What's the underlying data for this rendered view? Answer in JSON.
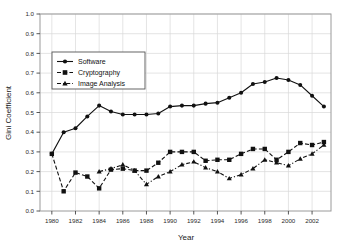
{
  "chart_data": {
    "type": "line",
    "title": "",
    "xlabel": "Year",
    "ylabel": "Gini Coefficient",
    "xlim": [
      1979,
      2003.6
    ],
    "ylim": [
      0.0,
      1.0
    ],
    "grid": true,
    "legend_position": "upper-left-inside",
    "x": [
      1980,
      1981,
      1982,
      1983,
      1984,
      1985,
      1986,
      1987,
      1988,
      1989,
      1990,
      1991,
      1992,
      1993,
      1994,
      1995,
      1996,
      1997,
      1998,
      1999,
      2000,
      2001,
      2002,
      2003
    ],
    "xticks": [
      1980,
      1982,
      1984,
      1986,
      1988,
      1990,
      1992,
      1994,
      1996,
      1998,
      2000,
      2002
    ],
    "xtick_labels": [
      "1980",
      "1982",
      "1984",
      "1986",
      "1988",
      "1990",
      "1992",
      "1994",
      "1996",
      "1998",
      "2000",
      "2002"
    ],
    "yticks": [
      0.0,
      0.1,
      0.2,
      0.3,
      0.4,
      0.5,
      0.6,
      0.7,
      0.8,
      0.9,
      1.0
    ],
    "ytick_labels": [
      "0.0",
      "0.1",
      "0.2",
      "0.3",
      "0.4",
      "0.5",
      "0.6",
      "0.7",
      "0.8",
      "0.9",
      "1.0"
    ],
    "series": [
      {
        "name": "Software",
        "marker": "circle",
        "linestyle": "solid",
        "color": "#111111",
        "x": [
          1980,
          1981,
          1982,
          1983,
          1984,
          1985,
          1986,
          1987,
          1988,
          1989,
          1990,
          1991,
          1992,
          1993,
          1994,
          1995,
          1996,
          1997,
          1998,
          1999,
          2000,
          2001,
          2002,
          2003
        ],
        "values": [
          0.29,
          0.4,
          0.42,
          0.48,
          0.535,
          0.505,
          0.49,
          0.49,
          0.49,
          0.495,
          0.53,
          0.535,
          0.535,
          0.545,
          0.55,
          0.575,
          0.6,
          0.645,
          0.655,
          0.675,
          0.665,
          0.64,
          0.585,
          0.53
        ]
      },
      {
        "name": "Cryptography",
        "marker": "square",
        "linestyle": "dashed",
        "color": "#111111",
        "x": [
          1980,
          1981,
          1982,
          1983,
          1984,
          1985,
          1986,
          1987,
          1988,
          1989,
          1990,
          1991,
          1992,
          1993,
          1994,
          1995,
          1996,
          1997,
          1998,
          1999,
          2000,
          2001,
          2002,
          2003
        ],
        "values": [
          0.29,
          0.1,
          0.195,
          0.175,
          0.115,
          0.21,
          0.215,
          0.205,
          0.205,
          0.245,
          0.3,
          0.3,
          0.3,
          0.255,
          0.26,
          0.26,
          0.29,
          0.315,
          0.315,
          0.26,
          0.3,
          0.345,
          0.335,
          0.35
        ]
      },
      {
        "name": "Image Analysis",
        "marker": "triangle",
        "linestyle": "dashdot",
        "color": "#111111",
        "x": [
          1984,
          1985,
          1986,
          1987,
          1988,
          1989,
          1990,
          1991,
          1992,
          1993,
          1994,
          1995,
          1996,
          1997,
          1998,
          1999,
          2000,
          2001,
          2002,
          2003
        ],
        "values": [
          0.2,
          0.215,
          0.235,
          0.205,
          0.135,
          0.175,
          0.2,
          0.235,
          0.25,
          0.22,
          0.2,
          0.165,
          0.185,
          0.215,
          0.26,
          0.245,
          0.23,
          0.265,
          0.29,
          0.335
        ]
      }
    ],
    "legend": [
      {
        "label": "Software",
        "marker": "circle",
        "linestyle": "solid"
      },
      {
        "label": "Cryptography",
        "marker": "square",
        "linestyle": "dashed"
      },
      {
        "label": "Image Analysis",
        "marker": "triangle",
        "linestyle": "dashdot"
      }
    ],
    "colors": {
      "line": "#111111",
      "grid": "#d8d8d8",
      "axis": "#9a9a9a",
      "text": "#1a1a1a",
      "background": "#ffffff"
    }
  }
}
